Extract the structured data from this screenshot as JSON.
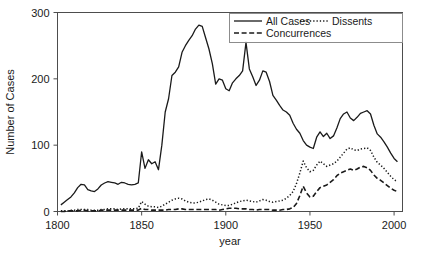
{
  "chart_data": {
    "type": "line",
    "title": "",
    "subtitle": "",
    "xlabel": "year",
    "ylabel": "Number of Cases",
    "xlim": [
      1800,
      2005
    ],
    "ylim": [
      0,
      300
    ],
    "xticks": [
      1800,
      1850,
      1900,
      1950,
      2000
    ],
    "xtick_labels": [
      "1800",
      "1850",
      "1900",
      "1950",
      "2000"
    ],
    "yticks": [
      0,
      100,
      200,
      300
    ],
    "ytick_labels": [
      "0",
      "100",
      "200",
      "300"
    ],
    "grid": false,
    "legend_position": "top-right-inside",
    "legend": [
      {
        "name": "All Cases",
        "style": "solid",
        "color": "#1a1a1a"
      },
      {
        "name": "Dissents",
        "style": "dotted",
        "color": "#1a1a1a"
      },
      {
        "name": "Concurrences",
        "style": "dashed",
        "color": "#1a1a1a"
      }
    ],
    "x": [
      1802,
      1804,
      1806,
      1808,
      1810,
      1812,
      1814,
      1816,
      1818,
      1820,
      1822,
      1824,
      1826,
      1828,
      1830,
      1832,
      1834,
      1836,
      1838,
      1840,
      1842,
      1844,
      1846,
      1848,
      1850,
      1852,
      1854,
      1856,
      1858,
      1860,
      1862,
      1864,
      1866,
      1868,
      1870,
      1872,
      1874,
      1876,
      1878,
      1880,
      1882,
      1884,
      1886,
      1888,
      1890,
      1892,
      1894,
      1896,
      1898,
      1900,
      1902,
      1904,
      1906,
      1908,
      1910,
      1912,
      1914,
      1916,
      1918,
      1920,
      1922,
      1924,
      1926,
      1928,
      1930,
      1932,
      1934,
      1936,
      1938,
      1940,
      1942,
      1944,
      1946,
      1948,
      1950,
      1952,
      1954,
      1956,
      1958,
      1960,
      1962,
      1964,
      1966,
      1968,
      1970,
      1972,
      1974,
      1976,
      1978,
      1980,
      1982,
      1984,
      1986,
      1988,
      1990,
      1992,
      1994,
      1996,
      1998,
      2000,
      2002
    ],
    "series": [
      {
        "name": "All Cases",
        "style": "solid",
        "color": "#1a1a1a",
        "values": [
          10,
          14,
          18,
          22,
          28,
          36,
          41,
          40,
          33,
          31,
          30,
          34,
          40,
          43,
          45,
          44,
          43,
          41,
          44,
          43,
          41,
          40,
          41,
          43,
          90,
          65,
          78,
          72,
          75,
          63,
          100,
          150,
          170,
          205,
          210,
          218,
          240,
          250,
          258,
          265,
          275,
          281,
          279,
          262,
          245,
          223,
          192,
          200,
          198,
          185,
          182,
          194,
          200,
          205,
          212,
          255,
          215,
          203,
          190,
          198,
          212,
          210,
          196,
          175,
          168,
          160,
          153,
          150,
          145,
          133,
          124,
          118,
          107,
          100,
          97,
          95,
          112,
          120,
          113,
          118,
          110,
          114,
          126,
          140,
          147,
          150,
          141,
          137,
          142,
          148,
          150,
          152,
          147,
          130,
          117,
          112,
          105,
          97,
          88,
          80,
          75
        ]
      },
      {
        "name": "Dissents",
        "style": "dotted",
        "color": "#1a1a1a",
        "values": [
          1,
          1,
          1,
          2,
          2,
          3,
          3,
          3,
          3,
          2,
          2,
          2,
          3,
          3,
          4,
          4,
          4,
          3,
          4,
          4,
          4,
          4,
          4,
          5,
          15,
          11,
          8,
          7,
          7,
          6,
          8,
          11,
          14,
          17,
          19,
          20,
          19,
          16,
          14,
          13,
          13,
          14,
          16,
          18,
          19,
          17,
          14,
          11,
          10,
          9,
          9,
          11,
          13,
          15,
          16,
          17,
          16,
          15,
          14,
          16,
          18,
          17,
          15,
          14,
          15,
          16,
          17,
          20,
          24,
          30,
          42,
          58,
          76,
          66,
          60,
          62,
          70,
          76,
          72,
          68,
          70,
          72,
          76,
          82,
          88,
          94,
          96,
          93,
          92,
          94,
          95,
          96,
          92,
          82,
          74,
          70,
          65,
          59,
          53,
          48,
          45
        ]
      },
      {
        "name": "Concurrences",
        "style": "dashed",
        "color": "#1a1a1a",
        "values": [
          0,
          0,
          1,
          1,
          1,
          1,
          2,
          2,
          1,
          1,
          1,
          1,
          2,
          2,
          2,
          2,
          2,
          2,
          2,
          2,
          2,
          2,
          2,
          2,
          5,
          3,
          3,
          2,
          2,
          2,
          2,
          2,
          3,
          3,
          3,
          4,
          4,
          3,
          3,
          3,
          3,
          3,
          3,
          3,
          3,
          3,
          3,
          2,
          3,
          4,
          5,
          5,
          5,
          4,
          4,
          4,
          3,
          3,
          2,
          3,
          3,
          3,
          3,
          2,
          2,
          2,
          3,
          3,
          4,
          6,
          12,
          24,
          38,
          28,
          22,
          23,
          30,
          36,
          38,
          40,
          44,
          48,
          54,
          58,
          60,
          62,
          64,
          62,
          64,
          67,
          68,
          66,
          62,
          55,
          50,
          47,
          43,
          39,
          35,
          32,
          30
        ]
      }
    ]
  }
}
